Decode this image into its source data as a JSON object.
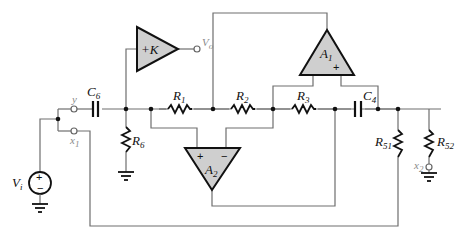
{
  "diagram": {
    "type": "active-filter-circuit",
    "labels": {
      "source": "V",
      "source_sub": "i",
      "output": "V",
      "output_sub": "o",
      "term_y": "y",
      "term_x1": "x",
      "term_x1_sub": "1",
      "term_x2": "x",
      "term_x2_sub": "2",
      "C6": "C",
      "C6_sub": "6",
      "C4": "C",
      "C4_sub": "4",
      "R1": "R",
      "R1_sub": "1",
      "R2": "R",
      "R2_sub": "2",
      "R3": "R",
      "R3_sub": "3",
      "R6": "R",
      "R6_sub": "6",
      "R51": "R",
      "R51_sub": "51",
      "R52": "R",
      "R52_sub": "52",
      "amp_K": "+K",
      "A1": "A",
      "A1_sub": "1",
      "A2": "A",
      "A2_sub": "2",
      "plus": "+",
      "minus": "−"
    },
    "components": [
      "Vi",
      "C6",
      "R6",
      "+K",
      "R1",
      "R2",
      "R3",
      "C4",
      "A1",
      "A2",
      "R51",
      "R52"
    ]
  }
}
